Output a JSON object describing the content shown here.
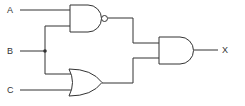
{
  "diagram": {
    "type": "logic-circuit",
    "inputs": [
      {
        "label": "A"
      },
      {
        "label": "B"
      },
      {
        "label": "C"
      }
    ],
    "output": {
      "label": "X"
    },
    "gates": [
      {
        "type": "NAND",
        "inputs": [
          "A",
          "B"
        ]
      },
      {
        "type": "OR",
        "inputs": [
          "B",
          "C"
        ]
      },
      {
        "type": "AND",
        "inputs": [
          "NAND",
          "OR"
        ],
        "output": "X"
      }
    ],
    "colors": {
      "stroke": "#333333",
      "background": "#ffffff"
    }
  }
}
